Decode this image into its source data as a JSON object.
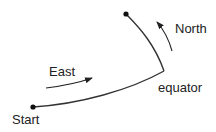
{
  "labels": {
    "start": "Start",
    "east": "East",
    "north": "North",
    "equator": "equator"
  },
  "colors": {
    "line": "#333333",
    "text": "#222222",
    "background": "#ffffff"
  }
}
